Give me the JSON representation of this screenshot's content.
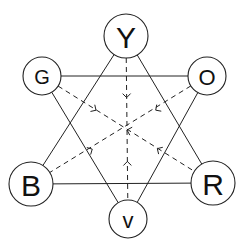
{
  "diagram": {
    "type": "color-wheel-hexagram",
    "nodes": [
      {
        "id": "Y",
        "label": "Y",
        "cx": 126,
        "cy": 36,
        "r": 22,
        "size": 30
      },
      {
        "id": "G",
        "label": "G",
        "cx": 42,
        "cy": 76,
        "r": 19,
        "size": 20
      },
      {
        "id": "O",
        "label": "O",
        "cx": 207,
        "cy": 76,
        "r": 19,
        "size": 22
      },
      {
        "id": "B",
        "label": "B",
        "cx": 31,
        "cy": 184,
        "r": 22,
        "size": 30
      },
      {
        "id": "R",
        "label": "R",
        "cx": 213,
        "cy": 183,
        "r": 22,
        "size": 30
      },
      {
        "id": "V",
        "label": "v",
        "cx": 128,
        "cy": 219,
        "r": 19,
        "size": 22
      }
    ],
    "solid_edges": [
      [
        "Y",
        "B"
      ],
      [
        "Y",
        "R"
      ],
      [
        "B",
        "R"
      ],
      [
        "G",
        "O"
      ],
      [
        "G",
        "V"
      ],
      [
        "O",
        "V"
      ]
    ],
    "dashed_edges": [
      [
        "Y",
        "V"
      ],
      [
        "G",
        "R"
      ],
      [
        "O",
        "B"
      ]
    ],
    "center": {
      "x": 127,
      "y": 130
    },
    "stroke_color": "#222222",
    "background": "#ffffff"
  }
}
